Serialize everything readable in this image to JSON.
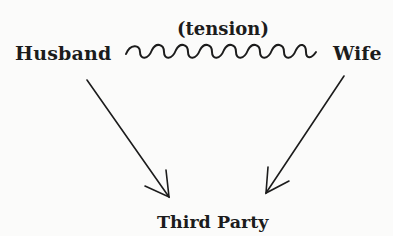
{
  "diagram": {
    "nodes": {
      "husband": "Husband",
      "wife": "Wife",
      "third_party": "Third Party"
    },
    "relations": {
      "husband_wife": "(tension)"
    },
    "edges": [
      {
        "from": "Husband",
        "to": "Wife",
        "style": "wavy",
        "label": "(tension)"
      },
      {
        "from": "Husband",
        "to": "Third Party",
        "style": "arrow"
      },
      {
        "from": "Wife",
        "to": "Third Party",
        "style": "arrow"
      }
    ],
    "colors": {
      "ink": "#1c1c1c",
      "background": "#fbfbfa"
    }
  }
}
